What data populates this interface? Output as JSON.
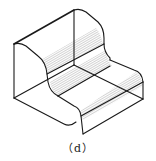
{
  "figure": {
    "caption": "（d）",
    "colors": {
      "line": "#1a1a1a",
      "hatch": "#555555",
      "background": "#ffffff"
    }
  }
}
